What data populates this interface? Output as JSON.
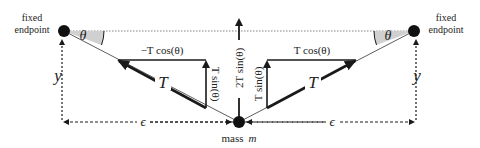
{
  "diagram": {
    "colors": {
      "ink": "#1a1a1a",
      "angle_fill": "#d0d0d0",
      "guide": "#555555"
    },
    "labels": {
      "left_endpoint_line1": "fixed",
      "left_endpoint_line2": "endpoint",
      "right_endpoint_line1": "fixed",
      "right_endpoint_line2": "endpoint",
      "left_theta": "θ",
      "right_theta": "θ",
      "left_y": "y",
      "right_y": "y",
      "left_epsilon": "ϵ",
      "right_epsilon": "ϵ",
      "mass": "mass",
      "mass_symbol": "m",
      "left_T": "T",
      "right_T": "T",
      "left_T_cos": "−T cos(θ)",
      "right_T_cos": "T cos(θ)",
      "left_T_sin": "T sin(θ)",
      "right_T_sin": "T sin(θ)",
      "net_force": "2T sin(θ)"
    },
    "points": {
      "left_endpoint": [
        64,
        31
      ],
      "right_endpoint": [
        414,
        31
      ],
      "mass": [
        239,
        122
      ]
    }
  }
}
